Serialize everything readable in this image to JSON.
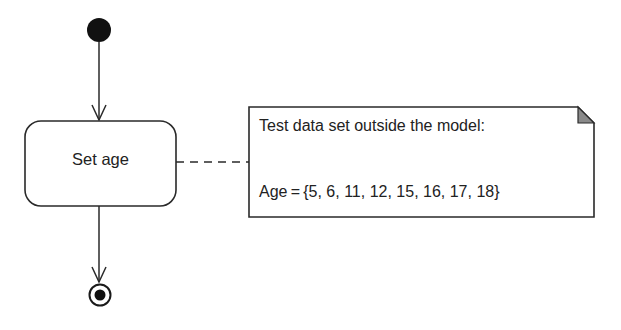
{
  "diagram": {
    "type": "uml-activity",
    "colors": {
      "stroke": "#2a2a2a",
      "node_fill": "#111111",
      "note_fold": "#8a8a8a",
      "background": "#ffffff"
    },
    "initial_node": {
      "name": "initial"
    },
    "action": {
      "label": "Set age"
    },
    "note": {
      "line1": "Test data set outside the model:",
      "line2": "Age = {5, 6, 11, 12, 15, 16, 17, 18}",
      "values": [
        5,
        6,
        11,
        12,
        15,
        16,
        17,
        18
      ]
    },
    "final_node": {
      "name": "final"
    },
    "edges": [
      {
        "from": "initial",
        "to": "Set age",
        "style": "solid-arrow"
      },
      {
        "from": "Set age",
        "to": "final",
        "style": "solid-arrow"
      },
      {
        "from": "Set age",
        "to": "note",
        "style": "dashed"
      }
    ]
  }
}
